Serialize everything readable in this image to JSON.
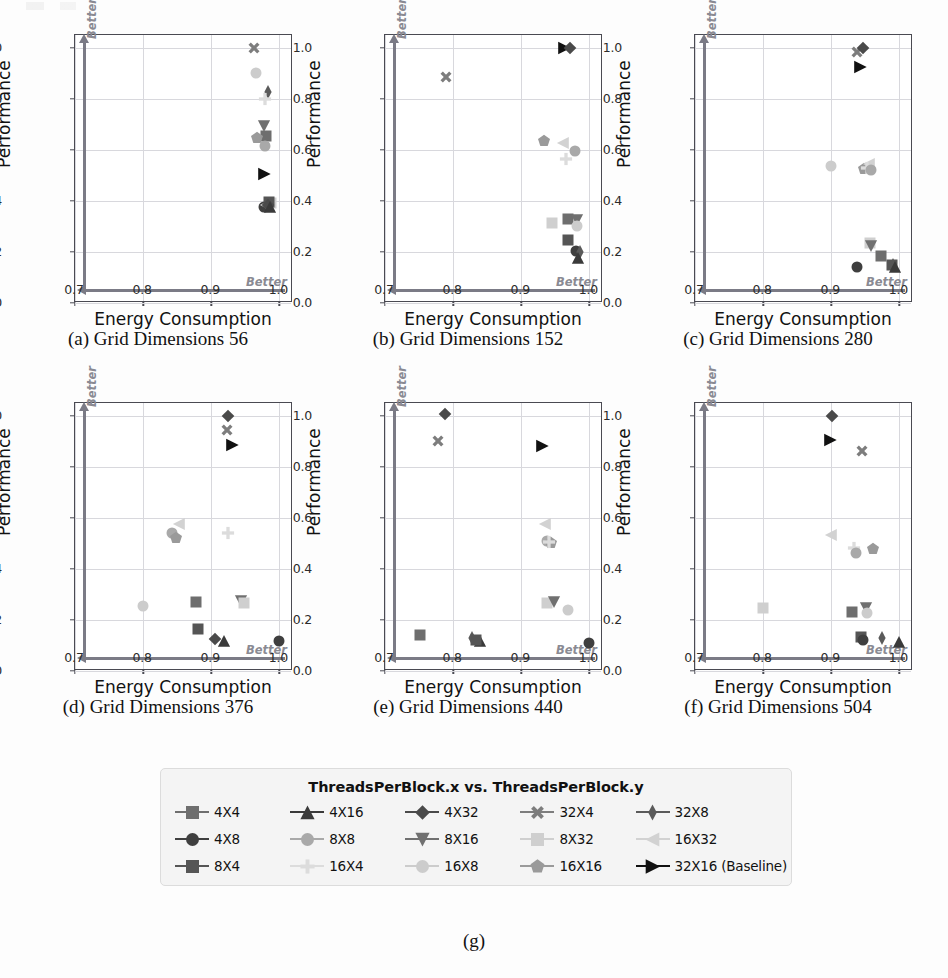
{
  "figure": {
    "subfigure_label": "(g)",
    "axis": {
      "xlabel": "Energy Consumption",
      "ylabel": "Performance",
      "xticks": [
        "0.7",
        "0.8",
        "0.9",
        "1.0"
      ],
      "xtick_values": [
        0.7,
        0.8,
        0.9,
        1.0
      ],
      "yticks": [
        "0.0",
        "0.2",
        "0.4",
        "0.6",
        "0.8",
        "1.0"
      ],
      "ytick_values": [
        0.0,
        0.2,
        0.4,
        0.6,
        0.8,
        1.0
      ],
      "xlim": [
        0.7,
        1.02
      ],
      "ylim": [
        0.0,
        1.05
      ],
      "better_x_label": "Better",
      "better_y_label": "Better"
    },
    "legend": {
      "title": "ThreadsPerBlock.x vs. ThreadsPerBlock.y",
      "entries": [
        {
          "label": "4X4",
          "marker": "square",
          "color": "#6e6e6e"
        },
        {
          "label": "4X16",
          "marker": "triangle-up",
          "color": "#3a3a3a"
        },
        {
          "label": "4X32",
          "marker": "diamond",
          "color": "#4a4a4a"
        },
        {
          "label": "32X4",
          "marker": "x-thick",
          "color": "#7d7d7d"
        },
        {
          "label": "32X8",
          "marker": "thin-diamond",
          "color": "#5a5a5a"
        },
        {
          "label": "4X8",
          "marker": "circle",
          "color": "#3f3f3f"
        },
        {
          "label": "8X8",
          "marker": "circle",
          "color": "#a9a9a9"
        },
        {
          "label": "8X16",
          "marker": "triangle-down",
          "color": "#707070"
        },
        {
          "label": "8X32",
          "marker": "square",
          "color": "#cfcfcf"
        },
        {
          "label": "16X32",
          "marker": "triangle-left",
          "color": "#d2d2d2"
        },
        {
          "label": "8X4",
          "marker": "square",
          "color": "#555555"
        },
        {
          "label": "16X4",
          "marker": "plus-thick",
          "color": "#dcdcdc"
        },
        {
          "label": "16X8",
          "marker": "circle",
          "color": "#cccccc"
        },
        {
          "label": "16X16",
          "marker": "pentagon",
          "color": "#9a9a9a"
        },
        {
          "label": "32X16 (Baseline)",
          "marker": "triangle-right",
          "color": "#111111"
        }
      ]
    },
    "panels": [
      {
        "letter": "(a)",
        "caption": "(a) Grid Dimensions 56",
        "grid_dimensions": 56
      },
      {
        "letter": "(b)",
        "caption": "(b) Grid Dimensions 152",
        "grid_dimensions": 152
      },
      {
        "letter": "(c)",
        "caption": "(c) Grid Dimensions 280",
        "grid_dimensions": 280
      },
      {
        "letter": "(d)",
        "caption": "(d) Grid Dimensions 376",
        "grid_dimensions": 376
      },
      {
        "letter": "(e)",
        "caption": "(e) Grid Dimensions 440",
        "grid_dimensions": 440
      },
      {
        "letter": "(f)",
        "caption": "(f) Grid Dimensions 504",
        "grid_dimensions": 504
      }
    ]
  },
  "chart_data": {
    "type": "scatter",
    "xlabel": "Energy Consumption",
    "ylabel": "Performance",
    "xlim": [
      0.7,
      1.02
    ],
    "ylim": [
      0.0,
      1.05
    ],
    "grid": true,
    "legend_position": "bottom-center",
    "legend_title": "ThreadsPerBlock.x vs. ThreadsPerBlock.y",
    "series_names": [
      "4X4",
      "4X16",
      "4X32",
      "32X4",
      "32X8",
      "4X8",
      "8X8",
      "8X16",
      "8X32",
      "16X32",
      "8X4",
      "16X4",
      "16X8",
      "16X16",
      "32X16 (Baseline)"
    ],
    "subplots": [
      {
        "name": "(a) Grid Dimensions 56",
        "grid_dimensions": 56,
        "points": [
          {
            "series": "32X4",
            "x": 0.963,
            "y": 1.0
          },
          {
            "series": "16X8",
            "x": 0.965,
            "y": 0.9
          },
          {
            "series": "32X8",
            "x": 0.983,
            "y": 0.825
          },
          {
            "series": "16X4",
            "x": 0.979,
            "y": 0.8
          },
          {
            "series": "8X16",
            "x": 0.978,
            "y": 0.695
          },
          {
            "series": "4X4",
            "x": 0.98,
            "y": 0.655
          },
          {
            "series": "16X16",
            "x": 0.967,
            "y": 0.645
          },
          {
            "series": "8X8",
            "x": 0.979,
            "y": 0.615
          },
          {
            "series": "32X16 (Baseline)",
            "x": 0.978,
            "y": 0.505
          },
          {
            "series": "4X8",
            "x": 0.977,
            "y": 0.375
          },
          {
            "series": "16X32",
            "x": 0.98,
            "y": 0.385
          },
          {
            "series": "8X32",
            "x": 0.987,
            "y": 0.39
          },
          {
            "series": "8X4",
            "x": 0.985,
            "y": 0.395
          },
          {
            "series": "4X32",
            "x": 0.983,
            "y": 0.383
          },
          {
            "series": "4X16",
            "x": 0.986,
            "y": 0.378
          }
        ]
      },
      {
        "name": "(b) Grid Dimensions 152",
        "grid_dimensions": 152,
        "points": [
          {
            "series": "32X16 (Baseline)",
            "x": 0.963,
            "y": 1.0
          },
          {
            "series": "4X32",
            "x": 0.971,
            "y": 1.0
          },
          {
            "series": "32X4",
            "x": 0.789,
            "y": 0.885
          },
          {
            "series": "16X16",
            "x": 0.933,
            "y": 0.635
          },
          {
            "series": "16X32",
            "x": 0.962,
            "y": 0.625
          },
          {
            "series": "8X8",
            "x": 0.979,
            "y": 0.595
          },
          {
            "series": "16X4",
            "x": 0.966,
            "y": 0.565
          },
          {
            "series": "8X32",
            "x": 0.945,
            "y": 0.315
          },
          {
            "series": "4X4",
            "x": 0.969,
            "y": 0.33
          },
          {
            "series": "8X16",
            "x": 0.982,
            "y": 0.325
          },
          {
            "series": "16X8",
            "x": 0.982,
            "y": 0.3
          },
          {
            "series": "8X4",
            "x": 0.968,
            "y": 0.245
          },
          {
            "series": "4X8",
            "x": 0.981,
            "y": 0.205
          },
          {
            "series": "32X8",
            "x": 0.986,
            "y": 0.2
          },
          {
            "series": "4X16",
            "x": 0.984,
            "y": 0.175
          }
        ]
      },
      {
        "name": "(c) Grid Dimensions 280",
        "grid_dimensions": 280,
        "points": [
          {
            "series": "32X4",
            "x": 0.938,
            "y": 0.985
          },
          {
            "series": "4X32",
            "x": 0.947,
            "y": 1.0
          },
          {
            "series": "32X16 (Baseline)",
            "x": 0.942,
            "y": 0.925
          },
          {
            "series": "16X8",
            "x": 0.899,
            "y": 0.535
          },
          {
            "series": "16X16",
            "x": 0.948,
            "y": 0.525
          },
          {
            "series": "16X32",
            "x": 0.955,
            "y": 0.545
          },
          {
            "series": "8X32",
            "x": 0.957,
            "y": 0.235
          },
          {
            "series": "8X16",
            "x": 0.959,
            "y": 0.225
          },
          {
            "series": "4X4",
            "x": 0.973,
            "y": 0.185
          },
          {
            "series": "4X8",
            "x": 0.938,
            "y": 0.14
          },
          {
            "series": "32X8",
            "x": 0.991,
            "y": 0.15
          },
          {
            "series": "8X4",
            "x": 0.989,
            "y": 0.148
          },
          {
            "series": "4X16",
            "x": 0.993,
            "y": 0.14
          },
          {
            "series": "16X4",
            "x": 0.953,
            "y": 0.53
          },
          {
            "series": "8X8",
            "x": 0.958,
            "y": 0.52
          }
        ]
      },
      {
        "name": "(d) Grid Dimensions 376",
        "grid_dimensions": 376,
        "points": [
          {
            "series": "4X32",
            "x": 0.924,
            "y": 1.0
          },
          {
            "series": "32X4",
            "x": 0.923,
            "y": 0.945
          },
          {
            "series": "32X16 (Baseline)",
            "x": 0.93,
            "y": 0.885
          },
          {
            "series": "16X32",
            "x": 0.852,
            "y": 0.575
          },
          {
            "series": "8X8",
            "x": 0.843,
            "y": 0.54
          },
          {
            "series": "16X16",
            "x": 0.848,
            "y": 0.52
          },
          {
            "series": "16X4",
            "x": 0.925,
            "y": 0.54
          },
          {
            "series": "16X8",
            "x": 0.8,
            "y": 0.255
          },
          {
            "series": "4X4",
            "x": 0.878,
            "y": 0.27
          },
          {
            "series": "8X16",
            "x": 0.944,
            "y": 0.275
          },
          {
            "series": "8X32",
            "x": 0.948,
            "y": 0.265
          },
          {
            "series": "8X4",
            "x": 0.88,
            "y": 0.165
          },
          {
            "series": "4X32",
            "x": 0.906,
            "y": 0.125
          },
          {
            "series": "4X16",
            "x": 0.918,
            "y": 0.118
          },
          {
            "series": "4X8",
            "x": 0.999,
            "y": 0.118
          }
        ]
      },
      {
        "name": "(e) Grid Dimensions 440",
        "grid_dimensions": 440,
        "points": [
          {
            "series": "4X32",
            "x": 0.788,
            "y": 1.005
          },
          {
            "series": "32X4",
            "x": 0.778,
            "y": 0.9
          },
          {
            "series": "32X16 (Baseline)",
            "x": 0.93,
            "y": 0.88
          },
          {
            "series": "16X32",
            "x": 0.935,
            "y": 0.575
          },
          {
            "series": "8X8",
            "x": 0.938,
            "y": 0.51
          },
          {
            "series": "16X16",
            "x": 0.944,
            "y": 0.5
          },
          {
            "series": "8X32",
            "x": 0.938,
            "y": 0.265
          },
          {
            "series": "8X16",
            "x": 0.948,
            "y": 0.27
          },
          {
            "series": "16X8",
            "x": 0.968,
            "y": 0.24
          },
          {
            "series": "4X4",
            "x": 0.751,
            "y": 0.14
          },
          {
            "series": "32X8",
            "x": 0.828,
            "y": 0.128
          },
          {
            "series": "4X16",
            "x": 0.84,
            "y": 0.118
          },
          {
            "series": "4X8",
            "x": 0.999,
            "y": 0.11
          },
          {
            "series": "16X4",
            "x": 0.94,
            "y": 0.505
          },
          {
            "series": "8X4",
            "x": 0.834,
            "y": 0.122
          }
        ]
      },
      {
        "name": "(f) Grid Dimensions 504",
        "grid_dimensions": 504,
        "points": [
          {
            "series": "4X32",
            "x": 0.901,
            "y": 1.0
          },
          {
            "series": "32X16 (Baseline)",
            "x": 0.898,
            "y": 0.905
          },
          {
            "series": "32X4",
            "x": 0.945,
            "y": 0.862
          },
          {
            "series": "16X32",
            "x": 0.9,
            "y": 0.532
          },
          {
            "series": "16X4",
            "x": 0.934,
            "y": 0.48
          },
          {
            "series": "8X8",
            "x": 0.936,
            "y": 0.462
          },
          {
            "series": "16X16",
            "x": 0.961,
            "y": 0.478
          },
          {
            "series": "8X32",
            "x": 0.8,
            "y": 0.245
          },
          {
            "series": "4X4",
            "x": 0.93,
            "y": 0.23
          },
          {
            "series": "8X16",
            "x": 0.951,
            "y": 0.248
          },
          {
            "series": "16X8",
            "x": 0.952,
            "y": 0.228
          },
          {
            "series": "8X4",
            "x": 0.944,
            "y": 0.135
          },
          {
            "series": "4X8",
            "x": 0.947,
            "y": 0.122
          },
          {
            "series": "32X8",
            "x": 0.974,
            "y": 0.128
          },
          {
            "series": "4X16",
            "x": 0.999,
            "y": 0.115
          }
        ]
      }
    ]
  }
}
